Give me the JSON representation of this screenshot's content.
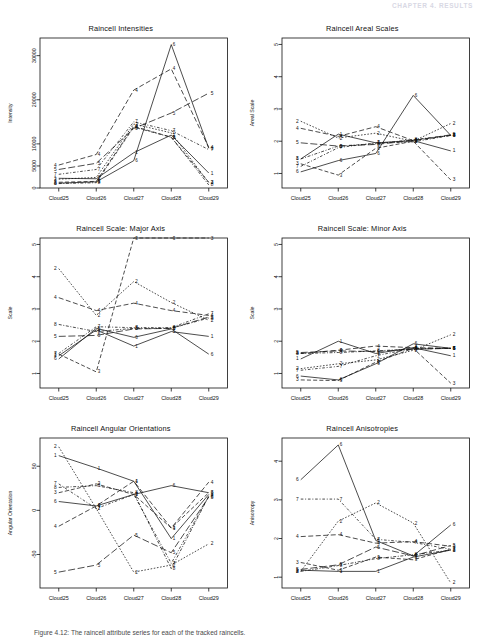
{
  "running_head": "CHAPTER 4. RESULTS",
  "caption": "Figure 4.12:  The raincell attribute series for each of the tracked raincells.",
  "axis": {
    "x_categories": [
      "Cloud25",
      "Cloud26",
      "Cloud27",
      "Cloud28",
      "Cloud29"
    ],
    "series_labels": [
      "1",
      "2",
      "3",
      "4",
      "5",
      "6",
      "7",
      "8"
    ]
  },
  "chart_data": [
    {
      "type": "line",
      "title": "Raincell Intensities",
      "xlabel": "",
      "ylabel": "Intensity",
      "x": [
        "Cloud25",
        "Cloud26",
        "Cloud27",
        "Cloud28",
        "Cloud29"
      ],
      "ylim": [
        0,
        34000
      ],
      "yticks": [
        0,
        5000,
        10000,
        20000,
        30000
      ],
      "ytick_labels": [
        "0",
        "5000",
        "10000",
        "20000",
        "30000"
      ],
      "grid": false,
      "legend": "inline-endpoint-labels",
      "series": [
        {
          "name": "1",
          "values": [
            2200,
            2100,
            8000,
            12000,
            3400
          ]
        },
        {
          "name": "2",
          "values": [
            2000,
            2400,
            14500,
            12500,
            1200
          ]
        },
        {
          "name": "3",
          "values": [
            1300,
            1500,
            14000,
            11500,
            1300
          ]
        },
        {
          "name": "4",
          "values": [
            5200,
            7600,
            22200,
            27000,
            9200
          ]
        },
        {
          "name": "5",
          "values": [
            4200,
            5600,
            13500,
            17000,
            21500
          ]
        },
        {
          "name": "6",
          "values": [
            1100,
            1400,
            6200,
            32500,
            9000
          ]
        },
        {
          "name": "7",
          "values": [
            3100,
            4200,
            15000,
            13000,
            8700
          ]
        },
        {
          "name": "8",
          "values": [
            1000,
            1200,
            13800,
            11500,
            700
          ]
        }
      ]
    },
    {
      "type": "line",
      "title": "Raincell Areal Scales",
      "xlabel": "",
      "ylabel": "Areal Scale",
      "x": [
        "Cloud25",
        "Cloud26",
        "Cloud27",
        "Cloud28",
        "Cloud29"
      ],
      "ylim": [
        0.55,
        5.2
      ],
      "yticks": [
        1,
        2,
        3,
        4,
        5
      ],
      "ytick_labels": [
        "1",
        "2",
        "3",
        "4",
        "5"
      ],
      "grid": false,
      "legend": "inline-endpoint-labels",
      "series": [
        {
          "name": "1",
          "values": [
            1.45,
            2.22,
            1.95,
            2.02,
            1.7
          ]
        },
        {
          "name": "2",
          "values": [
            2.62,
            2.1,
            2.25,
            2.0,
            2.55
          ]
        },
        {
          "name": "3",
          "values": [
            1.3,
            0.95,
            1.78,
            2.0,
            0.8
          ]
        },
        {
          "name": "4",
          "values": [
            2.4,
            2.15,
            2.45,
            2.02,
            2.18
          ]
        },
        {
          "name": "5",
          "values": [
            1.95,
            1.85,
            1.9,
            2.02,
            2.2
          ]
        },
        {
          "name": "6",
          "values": [
            1.05,
            1.4,
            1.62,
            3.42,
            2.18
          ]
        },
        {
          "name": "7",
          "values": [
            1.22,
            1.8,
            1.95,
            1.98,
            2.18
          ]
        },
        {
          "name": "8",
          "values": [
            1.45,
            1.85,
            1.92,
            2.05,
            2.18
          ]
        }
      ]
    },
    {
      "type": "line",
      "title": "Raincell Scale: Major Axis",
      "xlabel": "",
      "ylabel": "Scale",
      "x": [
        "Cloud25",
        "Cloud26",
        "Cloud27",
        "Cloud28",
        "Cloud29"
      ],
      "ylim": [
        0.55,
        5.2
      ],
      "yticks": [
        1,
        2,
        3,
        4,
        5
      ],
      "ytick_labels": [
        "1",
        "2",
        "3",
        "4",
        "5"
      ],
      "grid": false,
      "legend": "inline-endpoint-labels",
      "series": [
        {
          "name": "1",
          "values": [
            1.55,
            2.35,
            1.85,
            2.3,
            2.15
          ]
        },
        {
          "name": "2",
          "values": [
            4.25,
            2.8,
            3.85,
            3.2,
            2.65
          ]
        },
        {
          "name": "3",
          "values": [
            1.6,
            1.05,
            5.2,
            5.2,
            5.2
          ]
        },
        {
          "name": "4",
          "values": [
            3.35,
            2.95,
            3.18,
            2.95,
            2.8
          ]
        },
        {
          "name": "5",
          "values": [
            2.15,
            2.18,
            2.38,
            2.4,
            2.75
          ]
        },
        {
          "name": "6",
          "values": [
            1.45,
            2.4,
            2.12,
            2.38,
            1.6
          ]
        },
        {
          "name": "7",
          "values": [
            1.62,
            2.45,
            2.42,
            2.42,
            2.85
          ]
        },
        {
          "name": "8",
          "values": [
            2.52,
            2.3,
            2.4,
            2.4,
            2.72
          ]
        }
      ]
    },
    {
      "type": "line",
      "title": "Raincell Scale: Minor Axis",
      "xlabel": "",
      "ylabel": "Scale",
      "x": [
        "Cloud25",
        "Cloud26",
        "Cloud27",
        "Cloud28",
        "Cloud29"
      ],
      "ylim": [
        0.55,
        5.2
      ],
      "yticks": [
        1,
        2,
        3,
        4,
        5
      ],
      "ytick_labels": [
        "1",
        "2",
        "3",
        "4",
        "5"
      ],
      "grid": false,
      "legend": "inline-endpoint-labels",
      "series": [
        {
          "name": "1",
          "values": [
            1.45,
            2.0,
            1.62,
            1.8,
            1.55
          ]
        },
        {
          "name": "2",
          "values": [
            1.15,
            1.3,
            1.42,
            1.72,
            2.2
          ]
        },
        {
          "name": "3",
          "values": [
            0.8,
            0.78,
            1.35,
            1.78,
            0.7
          ]
        },
        {
          "name": "4",
          "values": [
            1.62,
            1.72,
            1.85,
            1.8,
            1.78
          ]
        },
        {
          "name": "5",
          "values": [
            1.65,
            1.7,
            1.68,
            1.75,
            1.78
          ]
        },
        {
          "name": "6",
          "values": [
            0.92,
            0.8,
            1.3,
            1.92,
            1.78
          ]
        },
        {
          "name": "7",
          "values": [
            1.1,
            1.22,
            1.55,
            1.78,
            1.78
          ]
        },
        {
          "name": "8",
          "values": [
            1.62,
            1.65,
            1.7,
            1.76,
            1.78
          ]
        }
      ]
    },
    {
      "type": "line",
      "title": "Raincell Angular Orientations",
      "xlabel": "",
      "ylabel": "Angular Orientation",
      "x": [
        "Cloud25",
        "Cloud26",
        "Cloud27",
        "Cloud28",
        "Cloud29"
      ],
      "ylim": [
        -88,
        82
      ],
      "yticks": [
        -50,
        0,
        50
      ],
      "ytick_labels": [
        "-50",
        "0",
        "50"
      ],
      "grid": false,
      "legend": "inline-endpoint-labels",
      "series": [
        {
          "name": "1",
          "values": [
            62,
            48,
            33,
            -32,
            18
          ]
        },
        {
          "name": "2",
          "values": [
            72,
            2,
            -70,
            -62,
            -38
          ]
        },
        {
          "name": "3",
          "values": [
            20,
            30,
            18,
            -20,
            20
          ]
        },
        {
          "name": "4",
          "values": [
            -18,
            5,
            33,
            -20,
            32
          ]
        },
        {
          "name": "5",
          "values": [
            -70,
            -62,
            -28,
            -48,
            15
          ]
        },
        {
          "name": "6",
          "values": [
            10,
            5,
            18,
            28,
            20
          ]
        },
        {
          "name": "7",
          "values": [
            30,
            2,
            18,
            -60,
            16
          ]
        },
        {
          "name": "8",
          "values": [
            26,
            28,
            20,
            -66,
            16
          ]
        }
      ]
    },
    {
      "type": "line",
      "title": "Raincell Anisotropies",
      "xlabel": "",
      "ylabel": "Anisotropy",
      "x": [
        "Cloud25",
        "Cloud26",
        "Cloud27",
        "Cloud28",
        "Cloud29"
      ],
      "ylim": [
        0.72,
        4.6
      ],
      "yticks": [
        1,
        2,
        3,
        4
      ],
      "ytick_labels": [
        "1",
        "2",
        "3",
        "4"
      ],
      "grid": false,
      "legend": "inline-endpoint-labels",
      "series": [
        {
          "name": "1",
          "values": [
            1.18,
            1.15,
            1.15,
            1.52,
            1.7
          ]
        },
        {
          "name": "2",
          "values": [
            1.15,
            2.45,
            2.92,
            2.4,
            0.85
          ]
        },
        {
          "name": "3",
          "values": [
            1.38,
            1.18,
            1.52,
            1.45,
            1.72
          ]
        },
        {
          "name": "4",
          "values": [
            2.05,
            2.1,
            1.88,
            1.92,
            1.8
          ]
        },
        {
          "name": "5",
          "values": [
            1.2,
            1.32,
            1.78,
            1.55,
            1.82
          ]
        },
        {
          "name": "6",
          "values": [
            3.52,
            4.42,
            1.95,
            1.55,
            2.35
          ]
        },
        {
          "name": "7",
          "values": [
            3.02,
            3.02,
            1.98,
            1.9,
            1.72
          ]
        },
        {
          "name": "8",
          "values": [
            1.15,
            1.3,
            1.48,
            1.58,
            1.7
          ]
        }
      ]
    }
  ]
}
